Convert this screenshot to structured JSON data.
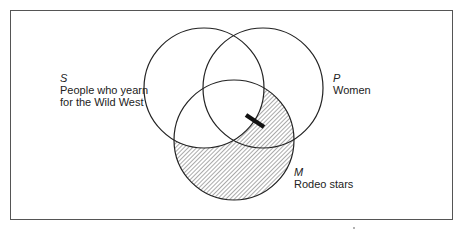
{
  "diagram": {
    "type": "venn",
    "sets": [
      {
        "letter": "S",
        "label_line1": "People who yearn",
        "label_line2": "for the Wild West"
      },
      {
        "letter": "P",
        "label_line1": "Women"
      },
      {
        "letter": "M",
        "label_line1": "Rodeo stars"
      }
    ],
    "shaded_region": "M outside S",
    "bar_marker": "on S boundary within P∩M",
    "colors": {
      "stroke": "#222222",
      "hatch": "#555555",
      "frame": "#555555"
    }
  }
}
